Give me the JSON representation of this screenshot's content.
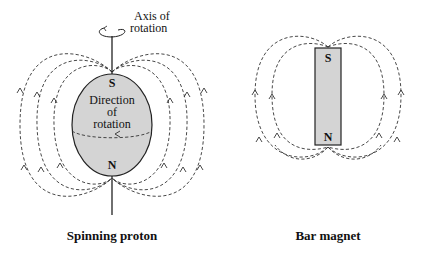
{
  "diagrams": [
    {
      "id": "spinning-proton",
      "caption": "Spinning proton",
      "labels": {
        "axis": [
          "Axis of",
          "rotation"
        ],
        "south": "S",
        "north": "N",
        "direction": [
          "Direction",
          "of",
          "rotation"
        ]
      }
    },
    {
      "id": "bar-magnet",
      "caption": "Bar magnet",
      "labels": {
        "south": "S",
        "north": "N"
      }
    }
  ],
  "colors": {
    "body_fill": "#d4d4d4",
    "stroke": "#333333",
    "background": "#ffffff"
  }
}
